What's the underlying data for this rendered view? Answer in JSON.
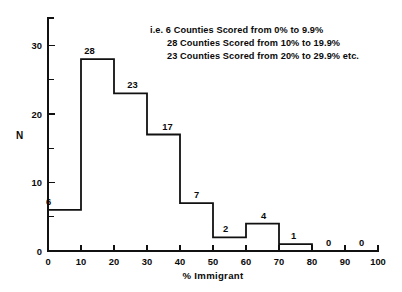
{
  "chart_data": {
    "type": "bar",
    "title": "",
    "xlabel": "% Immigrant",
    "ylabel": "N",
    "categories": [
      "0-10",
      "10-20",
      "20-30",
      "30-40",
      "40-50",
      "50-60",
      "60-70",
      "70-80",
      "80-90",
      "90-100"
    ],
    "bin_edges": [
      0,
      10,
      20,
      30,
      40,
      50,
      60,
      70,
      80,
      90,
      100
    ],
    "values": [
      6,
      28,
      23,
      17,
      7,
      2,
      4,
      1,
      0,
      0
    ],
    "value_labels": [
      "6",
      "28",
      "23",
      "17",
      "7",
      "2",
      "4",
      "1",
      "0",
      "0"
    ],
    "xlim": [
      0,
      100
    ],
    "ylim": [
      0,
      34
    ],
    "xticks": [
      0,
      10,
      20,
      30,
      40,
      50,
      60,
      70,
      80,
      90,
      100
    ],
    "xtick_labels": [
      "0",
      "10",
      "20",
      "30",
      "40",
      "50",
      "60",
      "70",
      "80",
      "90",
      "100"
    ],
    "yticks_major": [
      0,
      10,
      20,
      30
    ],
    "ytick_labels": [
      "0",
      "10",
      "20",
      "30"
    ],
    "yticks_minor": [
      5,
      15,
      25
    ],
    "grid": false,
    "legend": null,
    "style": "step-outline",
    "line_color": "#111111",
    "bg_color": "#ffffff"
  },
  "annotation": {
    "lines": [
      "i.e.  6 Counties Scored from 0% to 9.9%",
      "28 Counties Scored from 10% to 19.9%",
      "23 Counties Scored from 20% to 29.9% etc."
    ]
  }
}
